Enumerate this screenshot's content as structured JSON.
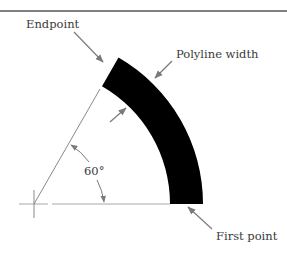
{
  "labels": {
    "endpoint": "Endpoint",
    "polyline_width": "Polyline width",
    "angle": "60°",
    "first_point": "First point"
  },
  "colors": {
    "arc_fill": "#000000",
    "leader": "#7a7a7a",
    "construction_line": "#a8a8a8",
    "top_rule": "#555555",
    "text": "#3a3a3a"
  },
  "geometry": {
    "center": [
      34,
      204
    ],
    "inner_radius": 136,
    "outer_radius": 169,
    "sweep_degrees": 60
  }
}
